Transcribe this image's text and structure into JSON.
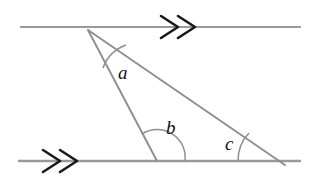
{
  "figure": {
    "type": "geometry-diagram",
    "width": 316,
    "height": 185,
    "background_color": "#ffffff"
  },
  "colors": {
    "line": "#9a9a9a",
    "triangle": "#8e8e8e",
    "arc": "#8e8e8e",
    "arrow": "#1a1a1a",
    "label": "#111111"
  },
  "parallel_lines": [
    {
      "name": "top-parallel-line",
      "x1": 20,
      "y1": 27,
      "x2": 301,
      "y2": 27,
      "marker": "double-chevron-right",
      "marker_x": 180,
      "marker_y": 27
    },
    {
      "name": "bottom-parallel-line",
      "x1": 18,
      "y1": 161,
      "x2": 301,
      "y2": 161,
      "marker": "double-chevron-right",
      "marker_x": 62,
      "marker_y": 161
    }
  ],
  "vertices": {
    "apex": {
      "label": "apex",
      "x": 88,
      "y": 30
    },
    "base_left": {
      "label": "base-left",
      "x": 157,
      "y": 161
    },
    "base_right": {
      "label": "base-right",
      "x": 278,
      "y": 161
    }
  },
  "segments": [
    {
      "name": "left-leg",
      "from": "apex",
      "to": "base_left",
      "x1": 88,
      "y1": 30,
      "x2": 157,
      "y2": 161
    },
    {
      "name": "hypotenuse",
      "from": "apex",
      "to": "base_right",
      "x1": 88,
      "y1": 30,
      "x2": 285,
      "y2": 165
    }
  ],
  "angles": [
    {
      "id": "a",
      "label": "a",
      "vertex": "apex",
      "label_x": 118,
      "label_y": 79,
      "arc_path": "M 103 68 A 38 38 0 0 1 126 45",
      "description": "angle at apex between left leg and hypotenuse"
    },
    {
      "id": "b",
      "label": "b",
      "vertex": "base_left",
      "label_x": 166,
      "label_y": 134,
      "arc_path": "M 142 134 A 28 28 0 0 1 185 161",
      "description": "angle at base-left between left leg and bottom line to the right"
    },
    {
      "id": "c",
      "label": "c",
      "vertex": "base_right",
      "label_x": 225,
      "label_y": 150,
      "arc_path": "M 238 161 A 40 40 0 0 1 249 133",
      "description": "angle at base-right between bottom line to the left and hypotenuse"
    }
  ]
}
